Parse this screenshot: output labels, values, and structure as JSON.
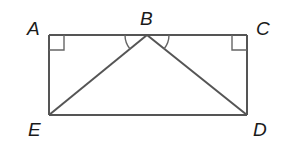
{
  "diagram": {
    "type": "geometry",
    "points": [
      {
        "id": "A",
        "label": "A",
        "x": 49,
        "y": 35
      },
      {
        "id": "B",
        "label": "B",
        "x": 147,
        "y": 35
      },
      {
        "id": "C",
        "label": "C",
        "x": 247,
        "y": 35
      },
      {
        "id": "D",
        "label": "D",
        "x": 247,
        "y": 115
      },
      {
        "id": "E",
        "label": "E",
        "x": 49,
        "y": 115
      }
    ],
    "segments": [
      "AC",
      "CD",
      "DE",
      "EA",
      "BE",
      "BD"
    ],
    "right_angles": [
      "A",
      "C"
    ],
    "angle_marks": [
      "ABE",
      "CBD"
    ],
    "labels": {
      "A": "A",
      "B": "B",
      "C": "C",
      "D": "D",
      "E": "E"
    },
    "colors": {
      "line": "#555555",
      "text": "#1a1a1a",
      "background": "#ffffff"
    }
  }
}
